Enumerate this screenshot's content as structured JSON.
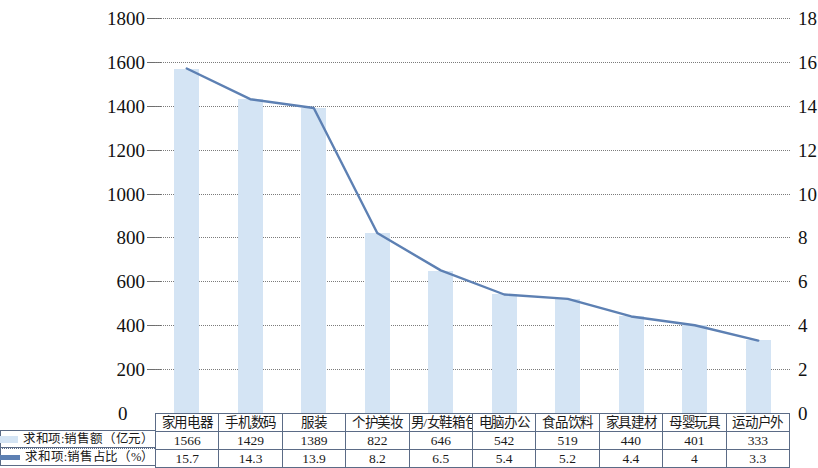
{
  "chart_data": {
    "type": "bar",
    "title": "",
    "subtitle": "",
    "xlabel": "",
    "ylabel": "",
    "categories": [
      "家用电器",
      "手机数码",
      "服装",
      "个护美妆",
      "男/女鞋箱包",
      "电脑办公",
      "食品饮料",
      "家具建材",
      "母婴玩具",
      "运动户外"
    ],
    "series": [
      {
        "name": "求和项:销售额（亿元）",
        "type": "bar",
        "axis": "left",
        "color": "#d4e4f4",
        "values": [
          1566,
          1429,
          1389,
          822,
          646,
          542,
          519,
          440,
          401,
          333
        ]
      },
      {
        "name": "求和项:销售占比（%）",
        "type": "line",
        "axis": "right",
        "color": "#5d80b3",
        "values": [
          15.7,
          14.3,
          13.9,
          8.2,
          6.5,
          5.4,
          5.2,
          4.4,
          4,
          3.3
        ]
      }
    ],
    "left_axis": {
      "min": 0,
      "max": 1800,
      "step": 200,
      "ticks": [
        0,
        200,
        400,
        600,
        800,
        1000,
        1200,
        1400,
        1600,
        1800
      ]
    },
    "right_axis": {
      "min": 0,
      "max": 18,
      "step": 2,
      "ticks": [
        0,
        2,
        4,
        6,
        8,
        10,
        12,
        14,
        16,
        18
      ]
    },
    "grid": true,
    "legend_position": "bottom-left"
  },
  "legend": {
    "bar_label": "求和项:销售额（亿元）",
    "line_label": "求和项:销售占比（%）",
    "bar_color": "#d4e4f4",
    "line_color": "#5d80b3"
  },
  "table": {
    "rows": [
      {
        "key": "categories",
        "cells": [
          "家用电器",
          "手机数码",
          "服装",
          "个护美妆",
          "男/女鞋箱包",
          "电脑办公",
          "食品饮料",
          "家具建材",
          "母婴玩具",
          "运动户外"
        ]
      },
      {
        "key": "sales",
        "cells": [
          "1566",
          "1429",
          "1389",
          "822",
          "646",
          "542",
          "519",
          "440",
          "401",
          "333"
        ]
      },
      {
        "key": "share",
        "cells": [
          "15.7",
          "14.3",
          "13.9",
          "8.2",
          "6.5",
          "5.4",
          "5.2",
          "4.4",
          "4",
          "3.3"
        ]
      }
    ]
  },
  "axis": {
    "left_ticks": [
      "1800",
      "1600",
      "1400",
      "1200",
      "1000",
      "800",
      "600",
      "400",
      "200",
      "0"
    ],
    "right_ticks": [
      "18",
      "16",
      "14",
      "12",
      "10",
      "8",
      "6",
      "4",
      "2",
      "0"
    ],
    "left_zero": "0",
    "right_zero": "0"
  }
}
